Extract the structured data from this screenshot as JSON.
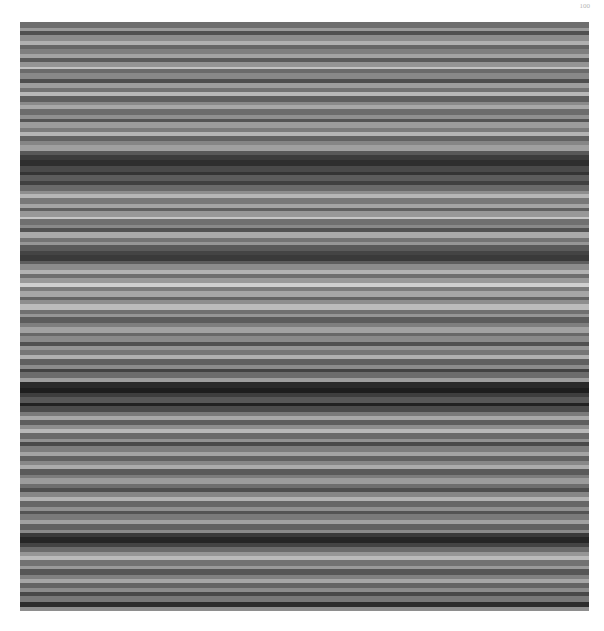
{
  "page": {
    "page_number": "100"
  },
  "image": {
    "description": "grayscale horizontal stripe pattern",
    "bands": [
      [
        "#6e6e6e",
        3
      ],
      [
        "#9a9a9a",
        2
      ],
      [
        "#505050",
        2
      ],
      [
        "#8c8c8c",
        3
      ],
      [
        "#b0b0b0",
        2
      ],
      [
        "#666666",
        2
      ],
      [
        "#7f7f7f",
        3
      ],
      [
        "#a3a3a3",
        2
      ],
      [
        "#5a5a5a",
        2
      ],
      [
        "#949494",
        3
      ],
      [
        "#c2c2c2",
        1
      ],
      [
        "#6a6a6a",
        2
      ],
      [
        "#888888",
        3
      ],
      [
        "#4e4e4e",
        2
      ],
      [
        "#9e9e9e",
        3
      ],
      [
        "#737373",
        2
      ],
      [
        "#b8b8b8",
        2
      ],
      [
        "#5f5f5f",
        3
      ],
      [
        "#8a8a8a",
        2
      ],
      [
        "#a8a8a8",
        2
      ],
      [
        "#6c6c6c",
        3
      ],
      [
        "#909090",
        2
      ],
      [
        "#545454",
        2
      ],
      [
        "#9c9c9c",
        3
      ],
      [
        "#7b7b7b",
        2
      ],
      [
        "#b4b4b4",
        2
      ],
      [
        "#626262",
        3
      ],
      [
        "#868686",
        2
      ],
      [
        "#a0a0a0",
        3
      ],
      [
        "#585858",
        2
      ],
      [
        "#3c3c3c",
        3
      ],
      [
        "#2e2e2e",
        3
      ],
      [
        "#4a4a4a",
        3
      ],
      [
        "#343434",
        2
      ],
      [
        "#5c5c5c",
        3
      ],
      [
        "#404040",
        2
      ],
      [
        "#6a6a6a",
        3
      ],
      [
        "#8e8e8e",
        2
      ],
      [
        "#b6b6b6",
        2
      ],
      [
        "#787878",
        3
      ],
      [
        "#a4a4a4",
        2
      ],
      [
        "#606060",
        2
      ],
      [
        "#989898",
        3
      ],
      [
        "#c6c6c6",
        1
      ],
      [
        "#707070",
        3
      ],
      [
        "#8a8a8a",
        2
      ],
      [
        "#525252",
        2
      ],
      [
        "#aaaaaa",
        3
      ],
      [
        "#747474",
        2
      ],
      [
        "#969696",
        2
      ],
      [
        "#5a5a5a",
        3
      ],
      [
        "#444444",
        2
      ],
      [
        "#3a3a3a",
        3
      ],
      [
        "#5e5e5e",
        2
      ],
      [
        "#8c8c8c",
        3
      ],
      [
        "#b2b2b2",
        2
      ],
      [
        "#6e6e6e",
        2
      ],
      [
        "#9a9a9a",
        3
      ],
      [
        "#d0d0d0",
        2
      ],
      [
        "#7c7c7c",
        2
      ],
      [
        "#a6a6a6",
        3
      ],
      [
        "#646464",
        2
      ],
      [
        "#8e8e8e",
        2
      ],
      [
        "#bcbcbc",
        3
      ],
      [
        "#707070",
        2
      ],
      [
        "#969696",
        2
      ],
      [
        "#5c5c5c",
        3
      ],
      [
        "#7e7e7e",
        2
      ],
      [
        "#a2a2a2",
        3
      ],
      [
        "#686868",
        2
      ],
      [
        "#8a8a8a",
        3
      ],
      [
        "#505050",
        2
      ],
      [
        "#949494",
        2
      ],
      [
        "#767676",
        3
      ],
      [
        "#b0b0b0",
        2
      ],
      [
        "#606060",
        3
      ],
      [
        "#8c8c8c",
        2
      ],
      [
        "#424242",
        2
      ],
      [
        "#6c6c6c",
        3
      ],
      [
        "#9e9e9e",
        2
      ],
      [
        "#2a2a2a",
        3
      ],
      [
        "#1e1e1e",
        3
      ],
      [
        "#3e3e3e",
        2
      ],
      [
        "#585858",
        3
      ],
      [
        "#222222",
        2
      ],
      [
        "#4c4c4c",
        3
      ],
      [
        "#7a7a7a",
        2
      ],
      [
        "#a8a8a8",
        2
      ],
      [
        "#5e5e5e",
        3
      ],
      [
        "#8e8e8e",
        2
      ],
      [
        "#b8b8b8",
        2
      ],
      [
        "#6a6a6a",
        3
      ],
      [
        "#929292",
        2
      ],
      [
        "#4a4a4a",
        2
      ],
      [
        "#7e7e7e",
        3
      ],
      [
        "#a4a4a4",
        2
      ],
      [
        "#626262",
        3
      ],
      [
        "#888888",
        2
      ],
      [
        "#acacac",
        2
      ],
      [
        "#5a5a5a",
        3
      ],
      [
        "#7c7c7c",
        2
      ],
      [
        "#9c9c9c",
        3
      ],
      [
        "#6e6e6e",
        2
      ],
      [
        "#4e4e4e",
        2
      ],
      [
        "#868686",
        3
      ],
      [
        "#b2b2b2",
        2
      ],
      [
        "#666666",
        3
      ],
      [
        "#909090",
        2
      ],
      [
        "#545454",
        2
      ],
      [
        "#7a7a7a",
        3
      ],
      [
        "#a0a0a0",
        2
      ],
      [
        "#606060",
        3
      ],
      [
        "#8a8a8a",
        2
      ],
      [
        "#3a3a3a",
        2
      ],
      [
        "#262626",
        3
      ],
      [
        "#444444",
        2
      ],
      [
        "#6c6c6c",
        3
      ],
      [
        "#969696",
        2
      ],
      [
        "#bababa",
        2
      ],
      [
        "#727272",
        3
      ],
      [
        "#9a9a9a",
        2
      ],
      [
        "#565656",
        3
      ],
      [
        "#808080",
        2
      ],
      [
        "#a6a6a6",
        2
      ],
      [
        "#646464",
        3
      ],
      [
        "#8c8c8c",
        2
      ],
      [
        "#484848",
        2
      ],
      [
        "#787878",
        3
      ],
      [
        "#2c2c2c",
        3
      ],
      [
        "#8e8e8e",
        2
      ]
    ]
  }
}
